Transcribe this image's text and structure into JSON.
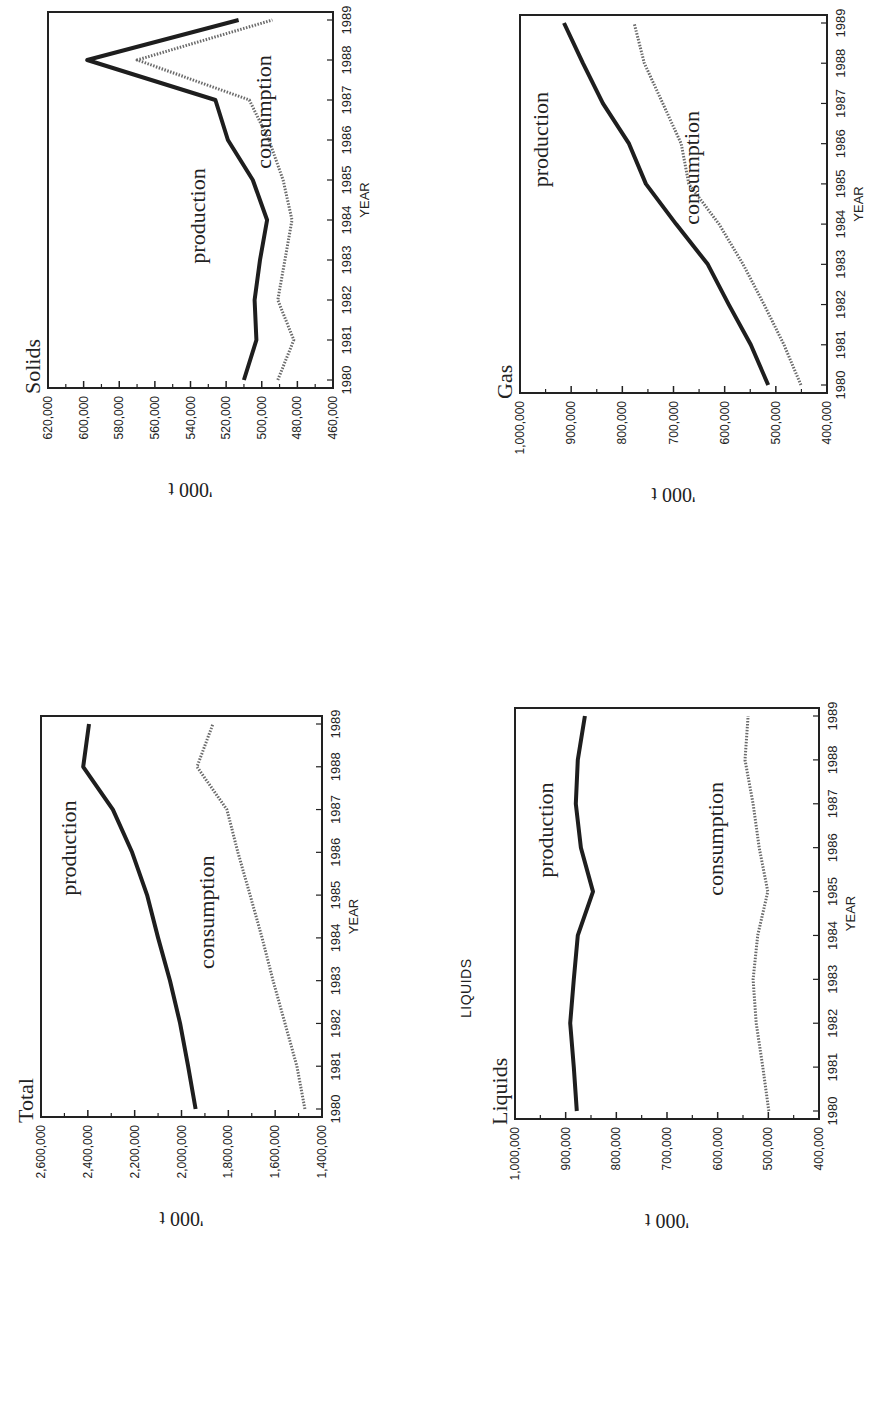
{
  "stray_label": "LIQUIDS",
  "chart_data": [
    {
      "id": "total",
      "type": "line",
      "title": "Total",
      "xlabel": "YEAR",
      "ylabel": "'000 t",
      "x": [
        1980,
        1981,
        1982,
        1983,
        1984,
        1985,
        1986,
        1987,
        1988,
        1989
      ],
      "ylim": [
        1400000,
        2600000
      ],
      "yticks": [
        1400000,
        1600000,
        1800000,
        2000000,
        2200000,
        2400000,
        2600000
      ],
      "ytick_labels": [
        "1,400,000",
        "1,600,000",
        "1,800,000",
        "2,000,000",
        "2,200,000",
        "2,400,000",
        "2,600,000"
      ],
      "grid": false,
      "legend": "inline labels",
      "series": [
        {
          "name": "production",
          "style": "solid-dark",
          "values": [
            1940000,
            1972000,
            2006000,
            2049000,
            2100000,
            2147000,
            2211000,
            2293000,
            2420000,
            2395000
          ],
          "label_at": {
            "year": 1986.1,
            "value": 2450000
          }
        },
        {
          "name": "consumption",
          "style": "dotted-grey",
          "values": [
            1473000,
            1507000,
            1558000,
            1609000,
            1656000,
            1707000,
            1759000,
            1806000,
            1934000,
            1866000
          ],
          "label_at": {
            "year": 1984.6,
            "value": 1860000
          }
        }
      ]
    },
    {
      "id": "solids",
      "type": "line",
      "title": "Solids",
      "xlabel": "YEAR",
      "ylabel": "'000 t",
      "x": [
        1980,
        1981,
        1982,
        1983,
        1984,
        1985,
        1986,
        1987,
        1988,
        1989
      ],
      "ylim": [
        460000,
        620000
      ],
      "yticks": [
        460000,
        480000,
        500000,
        520000,
        540000,
        560000,
        580000,
        600000,
        620000
      ],
      "ytick_labels": [
        "460,000",
        "480,000",
        "500,000",
        "520,000",
        "540,000",
        "560,000",
        "580,000",
        "600,000",
        "620,000"
      ],
      "grid": false,
      "legend": "inline labels",
      "series": [
        {
          "name": "production",
          "style": "solid-dark",
          "values": [
            510000,
            503000,
            504000,
            501000,
            497000,
            505000,
            519000,
            526000,
            598000,
            513000
          ],
          "label_at": {
            "year": 1984.1,
            "value": 532000
          }
        },
        {
          "name": "consumption",
          "style": "dotted-grey",
          "values": [
            491000,
            482000,
            491000,
            487000,
            483000,
            488000,
            496000,
            507000,
            570000,
            494000
          ],
          "label_at": {
            "year": 1986.7,
            "value": 495000
          }
        }
      ]
    },
    {
      "id": "liquids",
      "type": "line",
      "title": "Liquids",
      "xlabel": "YEAR",
      "ylabel": "'000 t",
      "x": [
        1980,
        1981,
        1982,
        1983,
        1984,
        1985,
        1986,
        1987,
        1988,
        1989
      ],
      "ylim": [
        400000,
        1000000
      ],
      "yticks": [
        400000,
        500000,
        600000,
        700000,
        800000,
        900000,
        1000000
      ],
      "ytick_labels": [
        "400,000",
        "500,000",
        "600,000",
        "700,000",
        "800,000",
        "900,000",
        "1,000,000"
      ],
      "grid": false,
      "legend": "inline labels",
      "series": [
        {
          "name": "production",
          "style": "solid-dark",
          "values": [
            878000,
            884000,
            891000,
            884000,
            876000,
            846000,
            870000,
            880000,
            876000,
            862000
          ],
          "label_at": {
            "year": 1986.4,
            "value": 925000
          }
        },
        {
          "name": "consumption",
          "style": "dotted-grey",
          "values": [
            499000,
            511000,
            524000,
            530000,
            521000,
            501000,
            518000,
            530000,
            546000,
            540000
          ],
          "label_at": {
            "year": 1986.2,
            "value": 590000
          }
        }
      ]
    },
    {
      "id": "gas",
      "type": "line",
      "title": "Gas",
      "xlabel": "YEAR",
      "ylabel": "'000 t",
      "x": [
        1980,
        1981,
        1982,
        1983,
        1984,
        1985,
        1986,
        1987,
        1988,
        1989
      ],
      "ylim": [
        400000,
        1000000
      ],
      "yticks": [
        400000,
        500000,
        600000,
        700000,
        800000,
        900000,
        1000000
      ],
      "ytick_labels": [
        "400,000",
        "500,000",
        "600,000",
        "700,000",
        "800,000",
        "900,000",
        "1,000,000"
      ],
      "grid": false,
      "legend": "inline labels",
      "series": [
        {
          "name": "production",
          "style": "solid-dark",
          "values": [
            515000,
            549000,
            592000,
            633000,
            695000,
            754000,
            787000,
            838000,
            877000,
            914000
          ],
          "label_at": {
            "year": 1986.1,
            "value": 945000
          }
        },
        {
          "name": "consumption",
          "style": "dotted-grey",
          "values": [
            451000,
            484000,
            523000,
            564000,
            611000,
            670000,
            685000,
            721000,
            757000,
            777000
          ],
          "label_at": {
            "year": 1985.4,
            "value": 650000
          }
        }
      ]
    }
  ]
}
